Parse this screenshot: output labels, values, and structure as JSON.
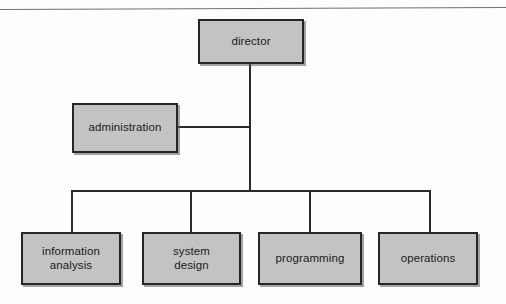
{
  "diagram": {
    "type": "org-chart",
    "title": "",
    "orientation": "top-down",
    "colors": {
      "node_fill": "#c3c3c3",
      "node_border": "#26262a",
      "connector": "#2b2b2e",
      "background": "#fdfdfc",
      "rule": "#6f6f6f"
    },
    "nodes": [
      {
        "id": "director",
        "label": "director",
        "level": 0,
        "x": 198,
        "y": 19,
        "w": 106,
        "h": 45
      },
      {
        "id": "administration",
        "label": "administration",
        "level": 1,
        "x": 72,
        "y": 103,
        "w": 106,
        "h": 50
      },
      {
        "id": "information-analysis",
        "label": "information\nanalysis",
        "level": 2,
        "x": 21,
        "y": 232,
        "w": 100,
        "h": 53
      },
      {
        "id": "system-design",
        "label": "system\ndesign",
        "level": 2,
        "x": 142,
        "y": 232,
        "w": 99,
        "h": 53
      },
      {
        "id": "programming",
        "label": "programming",
        "level": 2,
        "x": 258,
        "y": 232,
        "w": 104,
        "h": 53
      },
      {
        "id": "operations",
        "label": "operations",
        "level": 2,
        "x": 378,
        "y": 232,
        "w": 100,
        "h": 53
      }
    ],
    "edges": [
      {
        "from": "director",
        "to": "administration",
        "style": "elbow"
      },
      {
        "from": "director",
        "to": "information-analysis",
        "style": "elbow"
      },
      {
        "from": "director",
        "to": "system-design",
        "style": "elbow"
      },
      {
        "from": "director",
        "to": "programming",
        "style": "elbow"
      },
      {
        "from": "director",
        "to": "operations",
        "style": "elbow"
      }
    ]
  }
}
